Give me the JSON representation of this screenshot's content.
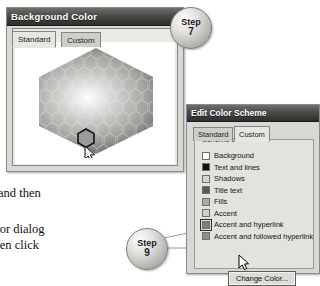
{
  "background_dialog": {
    "title": "Background Color",
    "tabs": [
      {
        "label": "Standard",
        "active": true
      },
      {
        "label": "Custom",
        "active": false
      }
    ],
    "colors_label": "Colors:",
    "picker": {
      "type": "hexagon-honeycomb",
      "selected_swatch_color": "#9b9b9b",
      "cursor": "arrow-pointer"
    }
  },
  "scheme_dialog": {
    "title": "Edit Color Scheme",
    "tabs": [
      {
        "label": "Standard",
        "active": false
      },
      {
        "label": "Custom",
        "active": true
      }
    ],
    "group_title": "Scheme colors",
    "color_rows": [
      {
        "label": "Background",
        "swatch": "#ffffff",
        "selected": false
      },
      {
        "label": "Text and lines",
        "swatch": "#121212",
        "selected": false
      },
      {
        "label": "Shadows",
        "swatch": "#d6d6d2",
        "selected": false
      },
      {
        "label": "Title text",
        "swatch": "#595959",
        "selected": false
      },
      {
        "label": "Fills",
        "swatch": "#a8a8a4",
        "selected": false
      },
      {
        "label": "Accent",
        "swatch": "#cfcfcb",
        "selected": false
      },
      {
        "label": "Accent and hyperlink",
        "swatch": "#7e7e7a",
        "selected": true
      },
      {
        "label": "Accent and followed hyperlink",
        "swatch": "#8e8e8a",
        "selected": false
      }
    ],
    "change_color_button": "Change Color..."
  },
  "callouts": [
    {
      "id": "step7",
      "word": "Step",
      "number": "7"
    },
    {
      "id": "step9",
      "word": "Step",
      "number": "9"
    }
  ],
  "prose": {
    "line1": "and then",
    "line2": "olor dialog",
    "line3": "then click"
  },
  "colors": {
    "titlebar_dark": "#2e2e2c",
    "dialog_face": "#d8d8d4",
    "panel_face": "#e9e9e5",
    "border": "#8a8a86",
    "leader_line": "#8d8d89"
  }
}
